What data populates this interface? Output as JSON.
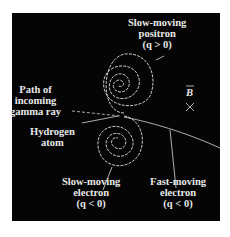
{
  "figure": {
    "background_color": "#050505",
    "line_color": "#e0e0e0",
    "labels": {
      "positron": {
        "line1": "Slow-moving",
        "line2": "positron",
        "line3": "(q > 0)"
      },
      "gamma": {
        "line1": "Path of",
        "line2": "incoming",
        "line3": "gamma ray"
      },
      "hydrogen": {
        "line1": "Hydrogen",
        "line2": "atom"
      },
      "slow_electron": {
        "line1": "Slow-moving",
        "line2": "electron",
        "line3": "(q < 0)"
      },
      "fast_electron": {
        "line1": "Fast-moving",
        "line2": "electron",
        "line3": "(q < 0)"
      },
      "field": {
        "symbol": "B",
        "direction_mark": "×"
      }
    }
  }
}
